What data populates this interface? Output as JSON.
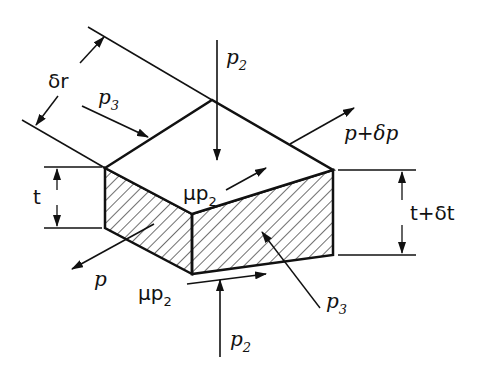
{
  "diagram": {
    "type": "isometric element with pressures",
    "labels": {
      "p2_top": "p",
      "p2_top_sub": "2",
      "p3_left": "p",
      "p3_left_sub": "3",
      "delta_r": "δr",
      "p_plus_dp": "p+δp",
      "t": "t",
      "t_plus_dt": "t+δt",
      "mu_p2_top": "μp",
      "mu_p2_top_sub": "2",
      "p_front": "p",
      "mu_p2_bottom": "μp",
      "mu_p2_bottom_sub": "2",
      "p3_right": "p",
      "p3_right_sub": "3",
      "p2_bottom": "p",
      "p2_bottom_sub": "2"
    },
    "colors": {
      "stroke": "#111111",
      "background": "#ffffff"
    }
  }
}
